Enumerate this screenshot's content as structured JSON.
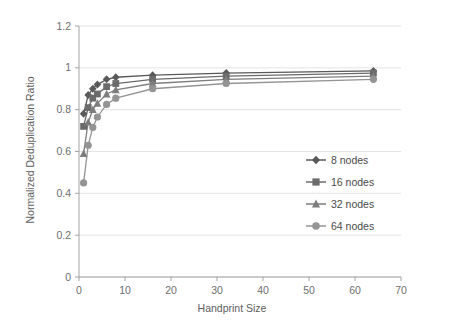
{
  "chart_data": {
    "type": "line",
    "title": "",
    "xlabel": "Handprint Size",
    "ylabel": "Normalized Deduplication Ratio",
    "xlim": [
      0,
      70
    ],
    "ylim": [
      0,
      1.2
    ],
    "xticks": [
      "0",
      "10",
      "20",
      "30",
      "40",
      "50",
      "60",
      "70"
    ],
    "xtick_values": [
      0,
      10,
      20,
      30,
      40,
      50,
      60,
      70
    ],
    "yticks": [
      "0",
      "0.2",
      "0.4",
      "0.6",
      "0.8",
      "1",
      "1.2"
    ],
    "ytick_values": [
      0,
      0.2,
      0.4,
      0.6,
      0.8,
      1,
      1.2
    ],
    "grid": "horizontal",
    "legend_position": "middle-right",
    "x": [
      1,
      2,
      3,
      4,
      6,
      8,
      16,
      32,
      64
    ],
    "series": [
      {
        "name": "8 nodes",
        "marker": "diamond",
        "color": "#595959",
        "values": [
          0.78,
          0.87,
          0.9,
          0.92,
          0.945,
          0.955,
          0.965,
          0.975,
          0.985
        ]
      },
      {
        "name": "16 nodes",
        "marker": "square",
        "color": "#6b6b6b",
        "values": [
          0.72,
          0.81,
          0.855,
          0.875,
          0.91,
          0.925,
          0.945,
          0.96,
          0.975
        ]
      },
      {
        "name": "32 nodes",
        "marker": "triangle",
        "color": "#7d7d7d",
        "values": [
          0.59,
          0.74,
          0.8,
          0.83,
          0.875,
          0.895,
          0.925,
          0.945,
          0.96
        ]
      },
      {
        "name": "64 nodes",
        "marker": "circle",
        "color": "#949494",
        "values": [
          0.45,
          0.63,
          0.715,
          0.765,
          0.825,
          0.855,
          0.9,
          0.925,
          0.945
        ]
      }
    ]
  },
  "legend": {
    "items": [
      {
        "label": "8 nodes"
      },
      {
        "label": "16 nodes"
      },
      {
        "label": "32 nodes"
      },
      {
        "label": "64 nodes"
      }
    ]
  }
}
